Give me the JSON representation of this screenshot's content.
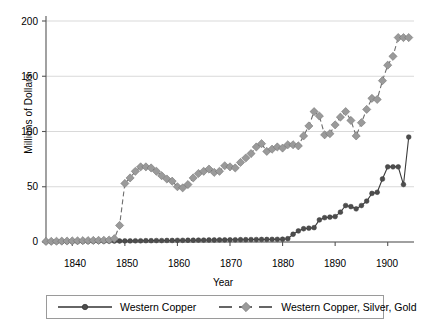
{
  "chart_data": {
    "type": "line",
    "title": "",
    "xlabel": "Year",
    "ylabel": "Millions of Dollars",
    "xlim": [
      1835,
      1905
    ],
    "ylim": [
      0,
      200
    ],
    "yticks": [
      0,
      50,
      100,
      150,
      200
    ],
    "xticks": [
      1840,
      1850,
      1860,
      1870,
      1880,
      1890,
      1900
    ],
    "grid": "horizontal",
    "legend_position": "below",
    "colors": {
      "western_copper": "#4d4d4d",
      "western_copper_silver_gold": "#9a9a9a",
      "gridline": "#d9d9d9",
      "axis": "#555555",
      "legend_border": "#9a9a9a",
      "background": "#ffffff"
    },
    "x": [
      1835,
      1836,
      1837,
      1838,
      1839,
      1840,
      1841,
      1842,
      1843,
      1844,
      1845,
      1846,
      1847,
      1848,
      1849,
      1850,
      1851,
      1852,
      1853,
      1854,
      1855,
      1856,
      1857,
      1858,
      1859,
      1860,
      1861,
      1862,
      1863,
      1864,
      1865,
      1866,
      1867,
      1868,
      1869,
      1870,
      1871,
      1872,
      1873,
      1874,
      1875,
      1876,
      1877,
      1878,
      1879,
      1880,
      1881,
      1882,
      1883,
      1884,
      1885,
      1886,
      1887,
      1888,
      1889,
      1890,
      1891,
      1892,
      1893,
      1894,
      1895,
      1896,
      1897,
      1898,
      1899,
      1900,
      1901,
      1902,
      1903,
      1904
    ],
    "series": [
      {
        "name": "Western Copper",
        "marker": "circle",
        "linestyle": "solid",
        "values": [
          0.2,
          0.2,
          0.3,
          0.3,
          0.3,
          0.4,
          0.4,
          0.5,
          0.5,
          0.6,
          0.6,
          0.7,
          0.8,
          0.8,
          0.9,
          1.0,
          1.0,
          1.1,
          1.1,
          1.2,
          1.2,
          1.3,
          1.3,
          1.4,
          1.4,
          1.5,
          1.5,
          1.6,
          1.6,
          1.7,
          1.7,
          1.8,
          1.8,
          1.9,
          1.9,
          2.0,
          2.0,
          2.1,
          2.1,
          2.2,
          2.2,
          2.3,
          2.3,
          2.4,
          2.4,
          2.5,
          3.0,
          7.0,
          10.0,
          12.0,
          12.5,
          13.0,
          20.0,
          22.0,
          22.5,
          23.0,
          27.0,
          33.0,
          32.0,
          30.0,
          33.0,
          37.0,
          44.0,
          45.0,
          57.0,
          68.0,
          68.0,
          68.0,
          52.0,
          95.0
        ]
      },
      {
        "name": "Western Copper, Silver, Gold",
        "marker": "diamond",
        "linestyle": "dashed",
        "values": [
          0.5,
          0.6,
          0.7,
          0.8,
          0.9,
          1.0,
          1.1,
          1.2,
          1.3,
          1.4,
          1.5,
          1.6,
          1.8,
          3.0,
          15.0,
          53.0,
          58.0,
          64.0,
          68.0,
          68.0,
          67.0,
          64.0,
          60.0,
          57.0,
          55.0,
          50.0,
          49.0,
          52.0,
          58.0,
          62.0,
          64.0,
          66.0,
          63.0,
          64.0,
          69.0,
          68.0,
          67.0,
          72.0,
          76.0,
          80.0,
          86.0,
          89.0,
          82.0,
          84.0,
          86.0,
          85.0,
          88.0,
          88.0,
          87.0,
          96.0,
          105.0,
          118.0,
          114.0,
          97.0,
          98.0,
          106.0,
          113.0,
          118.0,
          110.0,
          96.0,
          108.0,
          120.0,
          130.0,
          129.0,
          146.0,
          160.0,
          168.0,
          185.0,
          185.0,
          185.0
        ]
      }
    ]
  },
  "legend": {
    "items": [
      {
        "label": "Western Copper"
      },
      {
        "label": "Western Copper, Silver, Gold"
      }
    ]
  },
  "axes": {
    "ytick_labels": [
      "0",
      "50",
      "100",
      "150",
      "200"
    ],
    "xtick_labels": [
      "1840",
      "1850",
      "1860",
      "1870",
      "1880",
      "1890",
      "1900"
    ],
    "y_title": "Millions of Dollars",
    "x_title": "Year"
  }
}
